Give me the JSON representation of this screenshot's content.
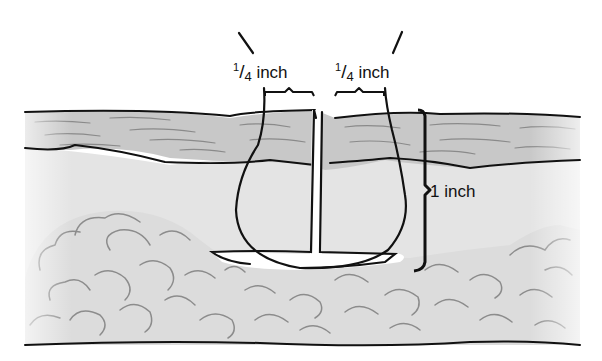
{
  "diagram": {
    "labels": {
      "left_margin": {
        "numerator": "1",
        "denominator": "4",
        "unit": "inch"
      },
      "right_margin": {
        "numerator": "1",
        "denominator": "4",
        "unit": "inch"
      },
      "depth": {
        "value": "1",
        "unit": "inch"
      }
    },
    "layers": [
      "epidermis/dermis (striated band)",
      "subcutaneous tissue (light gray)",
      "fat lobules (cloud pattern)"
    ],
    "colors": {
      "stroke": "#111111",
      "dermis_fill": "#c8c8c8",
      "subcutaneous_fill": "#e4e4e4",
      "fat_fill": "#dcdcdc",
      "fat_stroke": "#8c8c8c",
      "streak": "#8a8a8a",
      "background": "#ffffff"
    }
  }
}
